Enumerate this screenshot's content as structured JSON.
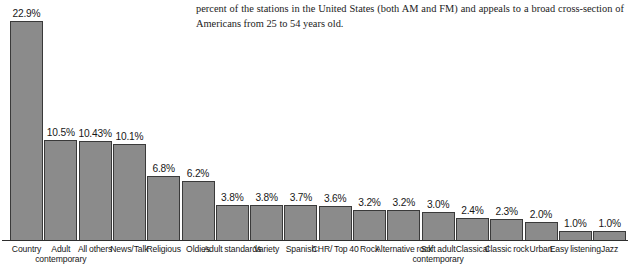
{
  "page": {
    "paragraph": "percent of the stations in the United States (both AM and FM) and appeals to a broad cross-section of Americans from 25 to 54 years old."
  },
  "chart_data": {
    "type": "bar",
    "title": "",
    "subtitle": "",
    "xlabel": "",
    "ylabel": "",
    "ylim": [
      0,
      22.9
    ],
    "grid": false,
    "legend": false,
    "value_suffix": "%",
    "bar_color": "#8b8b8b",
    "bar_border_color": "#3a3a3a",
    "axis_color": "#2e2e2e",
    "categories": [
      "Country",
      "Adult contemporary",
      "All others",
      "News/Talk",
      "Religious",
      "Oldies",
      "Adult standards",
      "Variety",
      "Spanish",
      "CHR/ Top 40",
      "Rock",
      "Alternative rock",
      "Soft adult contemporary",
      "Classical",
      "Classic rock",
      "Urban",
      "Easy listening",
      "Jazz"
    ],
    "values": [
      22.9,
      10.5,
      10.43,
      10.1,
      6.8,
      6.2,
      3.8,
      3.8,
      3.7,
      3.6,
      3.2,
      3.2,
      3.0,
      2.4,
      2.3,
      2.0,
      1.0,
      1.0
    ],
    "labels": [
      "22.9%",
      "10.5%",
      "10.43%",
      "10.1%",
      "6.8%",
      "6.2%",
      "3.8%",
      "3.8%",
      "3.7%",
      "3.6%",
      "3.2%",
      "3.2%",
      "3.0%",
      "2.4%",
      "2.3%",
      "2.0%",
      "1.0%",
      "1.0%"
    ]
  }
}
